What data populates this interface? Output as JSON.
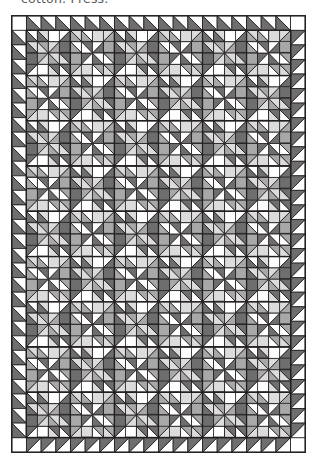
{
  "caption": {
    "text": "cotton. Press."
  },
  "figure": {
    "x": 11,
    "y": 15,
    "width": 295,
    "height": 438
  },
  "palette": {
    "background": "#ffffff",
    "outline": "#231f20",
    "fabric_white": "#ffffff",
    "fabric_light": "#dcdcdc",
    "fabric_medium": "#a8a8a8",
    "fabric_dark": "#6e6e6e",
    "fabric_darkest": "#565656",
    "caption_text": "#59595b"
  },
  "quilt": {
    "outer_frame": {
      "stroke_width": 1.3,
      "inset": 0.8
    },
    "border": {
      "name": "sawtooth-border",
      "unit_size": 14.6,
      "units_across": 19,
      "units_down": 28,
      "triangle_fill": "fabric_dark",
      "ground_fill": "fabric_white"
    },
    "body": {
      "name": "block-grid",
      "block_size": 43.8,
      "columns": 6,
      "rows": 9,
      "block_name": "pieced-star-block",
      "grid_stroke_width": 1.2
    },
    "unit_strokes": {
      "major": 1.2,
      "minor": 0.85
    },
    "stats": {
      "total_blocks": 54,
      "border_triangles": 94
    }
  }
}
